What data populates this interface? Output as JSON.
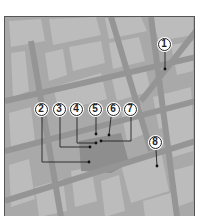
{
  "map": {
    "style": "grayscale street map",
    "colors": {
      "background": "#a9a9a9",
      "block": "#bcbcbc",
      "street": "#959595",
      "plaza": "#8e8e8e",
      "frame": "#555555"
    }
  },
  "callouts": [
    {
      "label": "1",
      "cx": 164,
      "cy": 44,
      "target": [
        164,
        68
      ],
      "path": "M164 51 L164 68"
    },
    {
      "label": "2",
      "cx": 41,
      "cy": 109,
      "target": [
        88,
        161
      ],
      "path": "M41 116 L41 161 L88 161"
    },
    {
      "label": "3",
      "cx": 59,
      "cy": 109,
      "target": [
        89,
        146
      ],
      "path": "M59 116 L59 146 L89 146"
    },
    {
      "label": "4",
      "cx": 76,
      "cy": 109,
      "target": [
        95,
        142
      ],
      "path": "M76 116 L76 142 L95 142"
    },
    {
      "label": "5",
      "cx": 95,
      "cy": 109,
      "target": [
        95,
        133
      ],
      "path": "M95 116 L95 133"
    },
    {
      "label": "6",
      "cx": 113,
      "cy": 109,
      "target": [
        108,
        134
      ],
      "path": "M110 116 L108 134"
    },
    {
      "label": "7",
      "cx": 130,
      "cy": 109,
      "target": [
        100,
        140
      ],
      "path": "M130 116 L130 140 L100 140"
    },
    {
      "label": "8",
      "cx": 155,
      "cy": 142,
      "target": [
        156,
        165
      ],
      "path": "M155 149 L156 165"
    }
  ]
}
